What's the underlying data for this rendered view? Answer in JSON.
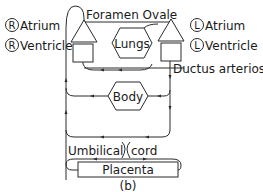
{
  "diagram": {
    "caption": "(b)",
    "legend_left": {
      "atrium": {
        "symbol": "R",
        "label": "Atrium"
      },
      "ventricle": {
        "symbol": "R",
        "label": "Ventricle"
      }
    },
    "legend_right": {
      "atrium": {
        "symbol": "L",
        "label": "Atrium"
      },
      "ventricle": {
        "symbol": "L",
        "label": "Ventricle"
      }
    },
    "labels": {
      "foramen_ovale": "Foramen Ovale",
      "ductus_arteriosus": "Ductus arteriosus",
      "umbilical": "Umbilical",
      "cord": "cord"
    },
    "nodes": {
      "lungs": "Lungs",
      "body": "Body",
      "placenta": "Placenta"
    },
    "colors": {
      "stroke": "#2a2a2a",
      "text": "#1a1a1a",
      "background": "#ffffff"
    }
  }
}
